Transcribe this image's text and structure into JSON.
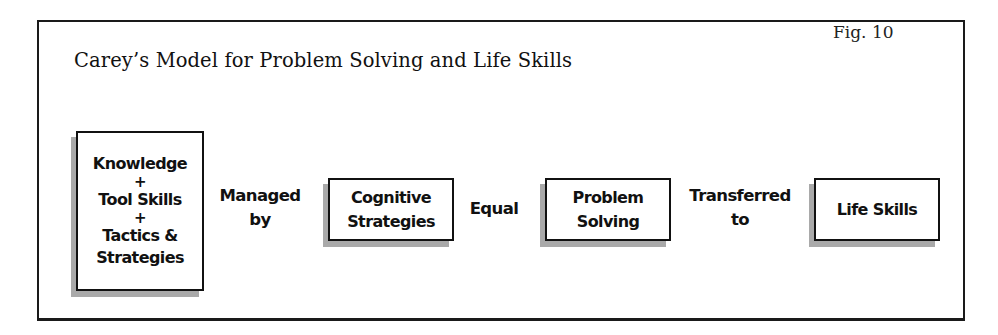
{
  "figure": {
    "label": "Fig. 10",
    "title": "Carey’s Model for Problem Solving and Life Skills"
  },
  "flow": {
    "box1": {
      "lines": [
        "Knowledge",
        "+",
        "Tool Skills",
        "+",
        "Tactics &",
        "Strategies"
      ]
    },
    "connector1": [
      "Managed",
      "by"
    ],
    "box2": [
      "Cognitive",
      "Strategies"
    ],
    "connector2": [
      "Equal"
    ],
    "box3": [
      "Problem",
      "Solving"
    ],
    "connector3": [
      "Transferred",
      "to"
    ],
    "box4": [
      "Life Skills"
    ]
  },
  "colors": {
    "border": "#111111",
    "shadow": "#a9a9a9",
    "background": "#ffffff"
  }
}
